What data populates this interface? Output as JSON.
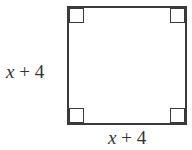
{
  "diagram": {
    "shape": "square",
    "right_angle_markers": [
      "top-left",
      "top-right",
      "bottom-left",
      "bottom-right"
    ],
    "labels": {
      "left_side": {
        "variable": "x",
        "rest": " + 4"
      },
      "bottom_side": {
        "variable": "x",
        "rest": " + 4"
      }
    },
    "colors": {
      "stroke": "#3a3a3a",
      "background": "#ffffff",
      "text": "#333333"
    }
  }
}
